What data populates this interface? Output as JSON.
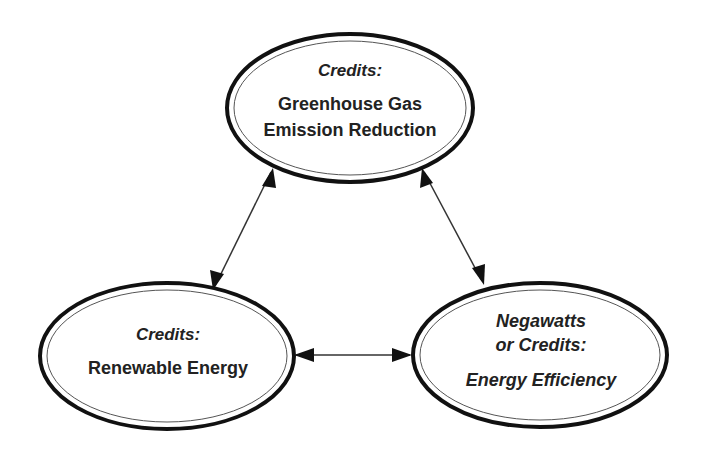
{
  "diagram": {
    "nodes": [
      {
        "id": "ghg",
        "lines": [
          {
            "text": "Credits:",
            "italic": true
          },
          {
            "text": "Greenhouse Gas",
            "italic": false
          },
          {
            "text": "Emission Reduction",
            "italic": false
          }
        ]
      },
      {
        "id": "renewable",
        "lines": [
          {
            "text": "Credits:",
            "italic": true
          },
          {
            "text": "Renewable Energy",
            "italic": false
          }
        ]
      },
      {
        "id": "efficiency",
        "lines": [
          {
            "text": "Negawatts",
            "italic": true
          },
          {
            "text": "or Credits:",
            "italic": true
          },
          {
            "text": "Energy Efficiency",
            "italic": true
          }
        ]
      }
    ],
    "edges": [
      {
        "from": "ghg",
        "to": "renewable",
        "type": "bidirectional"
      },
      {
        "from": "ghg",
        "to": "efficiency",
        "type": "bidirectional"
      },
      {
        "from": "renewable",
        "to": "efficiency",
        "type": "bidirectional"
      }
    ],
    "colors": {
      "stroke": "#111111",
      "text": "#222222",
      "background": "#ffffff"
    }
  }
}
